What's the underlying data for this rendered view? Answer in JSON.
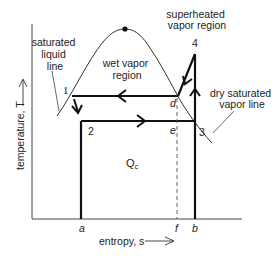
{
  "diagram": {
    "type": "T-s diagram (vapor-compression refrigeration cycle)",
    "axes": {
      "y_label": "temperature, T",
      "x_label": "entropy, s"
    },
    "region_labels": {
      "saturated_liquid_line": [
        "saturated",
        "liquid",
        "line"
      ],
      "wet_vapor_region": [
        "wet vapor",
        "region"
      ],
      "superheated_vapor_region": [
        "superheated",
        "vapor region"
      ],
      "dry_saturated_vapor_line": [
        "dry saturated",
        "vapor line"
      ]
    },
    "state_points": {
      "p1": "1",
      "p2": "2",
      "p3": "3",
      "p4": "4"
    },
    "auxiliary_points": {
      "d": "d",
      "e": "e"
    },
    "axis_points": {
      "a": "a",
      "f": "f",
      "b": "b"
    },
    "heat_label": {
      "main": "Q",
      "sub": "c"
    }
  }
}
